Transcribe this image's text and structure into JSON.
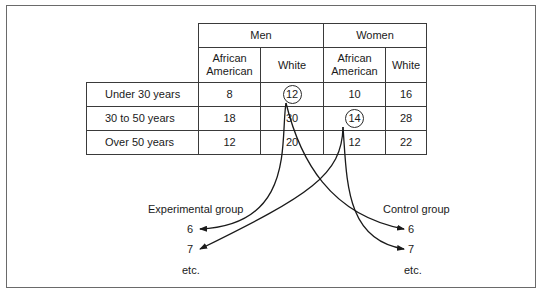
{
  "table": {
    "groups": [
      {
        "label": "Men"
      },
      {
        "label": "Women"
      }
    ],
    "subheaders": [
      {
        "line1": "African",
        "line2": "American"
      },
      {
        "label": "White"
      },
      {
        "line1": "African",
        "line2": "American"
      },
      {
        "label": "White"
      }
    ],
    "rows": [
      {
        "label": "Under 30 years",
        "values": [
          "8",
          "12",
          "10",
          "16"
        ],
        "circled_index": 1
      },
      {
        "label": "30 to 50 years",
        "values": [
          "18",
          "30",
          "14",
          "28"
        ],
        "circled_index": 2
      },
      {
        "label": "Over 50 years",
        "values": [
          "12",
          "20",
          "12",
          "22"
        ],
        "circled_index": null
      }
    ]
  },
  "assignment": {
    "experimental": {
      "title": "Experimental group",
      "items": [
        "6",
        "7"
      ],
      "more": "etc."
    },
    "control": {
      "title": "Control group",
      "items": [
        "6",
        "7"
      ],
      "more": "etc."
    }
  },
  "colors": {
    "line": "#1a1a1a",
    "border": "#3a3a3a",
    "frame": "#6a6a6a"
  }
}
